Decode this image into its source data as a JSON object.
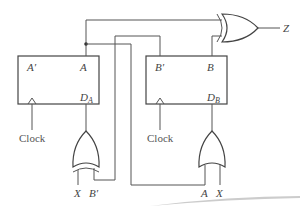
{
  "diagram": {
    "flipflops": [
      {
        "id": "A",
        "q_label": "A",
        "qbar_label": "A′",
        "d_label": "D",
        "d_sub": "A",
        "clock_label": "Clock"
      },
      {
        "id": "B",
        "q_label": "B",
        "qbar_label": "B′",
        "d_label": "D",
        "d_sub": "B",
        "clock_label": "Clock"
      }
    ],
    "gates": [
      {
        "id": "xor-DA",
        "type": "XOR",
        "inputs": [
          "X",
          "B′"
        ],
        "output": "DA"
      },
      {
        "id": "or-DB",
        "type": "OR",
        "inputs": [
          "A",
          "X"
        ],
        "output": "DB"
      },
      {
        "id": "xor-Z",
        "type": "XOR",
        "inputs": [
          "A",
          "B"
        ],
        "output": "Z"
      }
    ],
    "inputs": {
      "xor_x": "X",
      "xor_bprime": "B′",
      "or_a": "A",
      "or_x": "X"
    },
    "output_label": "Z"
  }
}
